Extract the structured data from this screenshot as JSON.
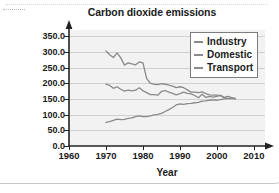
{
  "chart_data": {
    "type": "line",
    "title": "Carbon dioxide emissions",
    "xlabel": "Year",
    "ylabel_line1": "Million tonnes of",
    "ylabel_line2": "CO2 equivalent",
    "ylabel": "Million tonnes of CO2 equivalent",
    "xlim": [
      1960,
      2013
    ],
    "ylim": [
      0,
      370
    ],
    "xticks": [
      1960,
      1970,
      1980,
      1990,
      2000,
      2010
    ],
    "xtick_labels": [
      "1960",
      "1970",
      "1980",
      "1990",
      "2000",
      "2010"
    ],
    "yticks": [
      0,
      50,
      100,
      150,
      200,
      250,
      300,
      350
    ],
    "ytick_labels": [
      "0.0",
      "50.0",
      "100.0",
      "150.0",
      "200.0",
      "250.0",
      "300.0",
      "350.0"
    ],
    "grid": true,
    "grid_axis": "y",
    "legend_position": "top-right",
    "plot_background": "#f2f2f2",
    "line_color": "#8a8a8a",
    "series": [
      {
        "name": "Industry",
        "x": [
          1970,
          1971,
          1972,
          1973,
          1974,
          1975,
          1976,
          1977,
          1978,
          1979,
          1980,
          1981,
          1982,
          1983,
          1984,
          1985,
          1986,
          1987,
          1988,
          1989,
          1990,
          1991,
          1992,
          1993,
          1994,
          1995,
          1996,
          1997,
          1998,
          1999,
          2000,
          2001,
          2002,
          2003,
          2004,
          2005
        ],
        "values": [
          303,
          291,
          282,
          297,
          281,
          258,
          265,
          262,
          259,
          268,
          265,
          215,
          200,
          197,
          196,
          199,
          197,
          194,
          191,
          186,
          189,
          186,
          179,
          172,
          172,
          170,
          173,
          167,
          163,
          162,
          162,
          160,
          154,
          152,
          151,
          150
        ]
      },
      {
        "name": "Domestic",
        "x": [
          1970,
          1971,
          1972,
          1973,
          1974,
          1975,
          1976,
          1977,
          1978,
          1979,
          1980,
          1981,
          1982,
          1983,
          1984,
          1985,
          1986,
          1987,
          1988,
          1989,
          1990,
          1991,
          1992,
          1993,
          1994,
          1995,
          1996,
          1997,
          1998,
          1999,
          2000,
          2001,
          2002,
          2003,
          2004,
          2005
        ],
        "values": [
          197,
          193,
          184,
          189,
          181,
          175,
          178,
          176,
          178,
          186,
          176,
          170,
          164,
          164,
          162,
          174,
          177,
          172,
          168,
          163,
          167,
          172,
          168,
          166,
          161,
          154,
          165,
          155,
          158,
          156,
          158,
          162,
          155,
          158,
          154,
          151
        ]
      },
      {
        "name": "Transport",
        "x": [
          1970,
          1971,
          1972,
          1973,
          1974,
          1975,
          1976,
          1977,
          1978,
          1979,
          1980,
          1981,
          1982,
          1983,
          1984,
          1985,
          1986,
          1987,
          1988,
          1989,
          1990,
          1991,
          1992,
          1993,
          1994,
          1995,
          1996,
          1997,
          1998,
          1999,
          2000,
          2001,
          2002,
          2003,
          2004,
          2005
        ],
        "values": [
          75,
          78,
          82,
          86,
          84,
          85,
          88,
          90,
          94,
          96,
          94,
          94,
          96,
          99,
          101,
          104,
          110,
          116,
          123,
          131,
          134,
          133,
          135,
          136,
          138,
          139,
          143,
          144,
          146,
          147,
          146,
          148,
          150,
          151,
          152,
          152
        ]
      }
    ]
  },
  "legend": {
    "items": [
      {
        "label": "Industry"
      },
      {
        "label": "Domestic"
      },
      {
        "label": "Transport"
      }
    ]
  }
}
